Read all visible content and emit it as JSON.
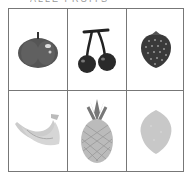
{
  "header": {
    "text": "ALLE FRUITS"
  },
  "grid": {
    "rows": 2,
    "columns": 3,
    "cells": [
      {
        "fruit": "tomato",
        "icon": "tomato-icon"
      },
      {
        "fruit": "cherries",
        "icon": "cherries-icon"
      },
      {
        "fruit": "strawberry",
        "icon": "strawberry-icon"
      },
      {
        "fruit": "bananas",
        "icon": "bananas-icon"
      },
      {
        "fruit": "pineapple",
        "icon": "pineapple-icon"
      },
      {
        "fruit": "lemon",
        "icon": "lemon-icon"
      }
    ]
  }
}
